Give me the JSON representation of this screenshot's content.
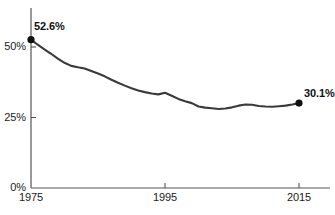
{
  "chart_data": {
    "type": "line",
    "title": "",
    "subtitle": "",
    "xlabel": "",
    "ylabel": "",
    "xlim": [
      1975,
      2017
    ],
    "ylim": [
      0,
      57
    ],
    "grid": false,
    "legend": null,
    "x_tick_labels": [
      "1975",
      "1995",
      "2015"
    ],
    "x_ticks": [
      1975,
      1995,
      2015
    ],
    "y_tick_labels": [
      "0%",
      "25%",
      "50%"
    ],
    "y_ticks": [
      0,
      25,
      50
    ],
    "line_color": "#3a3a3a",
    "marker_color": "#111111",
    "axis_color": "#555555",
    "series": [
      {
        "name": "share",
        "x": [
          1975,
          1976,
          1977,
          1978,
          1979,
          1980,
          1981,
          1982,
          1983,
          1984,
          1985,
          1986,
          1987,
          1988,
          1989,
          1990,
          1991,
          1992,
          1993,
          1994,
          1995,
          1996,
          1997,
          1998,
          1999,
          2000,
          2001,
          2002,
          2003,
          2004,
          2005,
          2006,
          2007,
          2008,
          2009,
          2010,
          2011,
          2012,
          2013,
          2014,
          2015
        ],
        "values": [
          52.6,
          50.8,
          49.2,
          47.6,
          45.9,
          44.4,
          43.3,
          42.8,
          42.4,
          41.5,
          40.6,
          39.6,
          38.4,
          37.3,
          36.3,
          35.4,
          34.6,
          34.0,
          33.5,
          33.2,
          33.8,
          32.7,
          31.6,
          30.8,
          30.1,
          28.9,
          28.5,
          28.3,
          28.0,
          28.2,
          28.6,
          29.2,
          29.6,
          29.5,
          29.1,
          28.9,
          28.8,
          29.0,
          29.2,
          29.6,
          30.1
        ]
      }
    ],
    "annotations": [
      {
        "name": "start-value",
        "label": "52.6%",
        "x": 1975,
        "y": 52.6
      },
      {
        "name": "end-value",
        "label": "30.1%",
        "x": 2015,
        "y": 30.1
      }
    ]
  }
}
